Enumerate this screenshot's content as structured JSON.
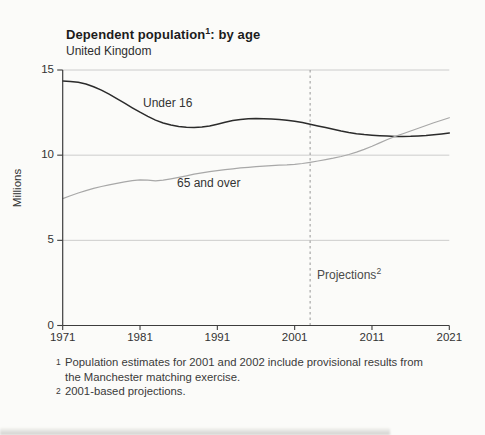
{
  "chart_data": {
    "type": "line",
    "title_main": "Dependent population",
    "title_sup": "1",
    "title_rest": ": by age",
    "subtitle": "United Kingdom",
    "ylabel": "Millions",
    "xlabel": "",
    "ylim": [
      0,
      15
    ],
    "yticks": [
      0,
      5,
      10,
      15
    ],
    "xlim": [
      1971,
      2021
    ],
    "xticks": [
      1971,
      1981,
      1991,
      2001,
      2011,
      2021
    ],
    "grid": "horizontal",
    "gridline_color": "#cccccc",
    "axis_color": "#3d3d3d",
    "projection_year": 2003,
    "projection_label": "Projections",
    "projection_sup": "2",
    "projection_line_color": "#979797",
    "x": [
      1971,
      1972,
      1973,
      1974,
      1975,
      1976,
      1977,
      1978,
      1979,
      1980,
      1981,
      1982,
      1983,
      1984,
      1985,
      1986,
      1987,
      1988,
      1989,
      1990,
      1991,
      1992,
      1993,
      1994,
      1995,
      1996,
      1997,
      1998,
      1999,
      2000,
      2001,
      2002,
      2003,
      2004,
      2005,
      2006,
      2007,
      2008,
      2009,
      2010,
      2011,
      2012,
      2013,
      2014,
      2015,
      2016,
      2017,
      2018,
      2019,
      2020,
      2021
    ],
    "series": [
      {
        "name": "Under 16",
        "color": "#2b2b2b",
        "stroke_width": 1.5,
        "values": [
          14.35,
          14.33,
          14.28,
          14.18,
          14.02,
          13.82,
          13.58,
          13.32,
          13.05,
          12.78,
          12.52,
          12.28,
          12.06,
          11.89,
          11.77,
          11.69,
          11.64,
          11.62,
          11.65,
          11.72,
          11.82,
          11.93,
          12.03,
          12.1,
          12.14,
          12.15,
          12.14,
          12.12,
          12.09,
          12.05,
          11.99,
          11.91,
          11.82,
          11.72,
          11.62,
          11.52,
          11.42,
          11.33,
          11.26,
          11.21,
          11.17,
          11.14,
          11.12,
          11.1,
          11.1,
          11.11,
          11.13,
          11.16,
          11.2,
          11.25,
          11.3
        ]
      },
      {
        "name": "65 and over",
        "color": "#a8a8a8",
        "stroke_width": 1.2,
        "values": [
          7.45,
          7.62,
          7.78,
          7.92,
          8.05,
          8.16,
          8.26,
          8.35,
          8.43,
          8.5,
          8.55,
          8.53,
          8.49,
          8.53,
          8.61,
          8.7,
          8.79,
          8.88,
          8.96,
          9.03,
          9.09,
          9.15,
          9.2,
          9.25,
          9.29,
          9.33,
          9.36,
          9.39,
          9.41,
          9.43,
          9.46,
          9.51,
          9.58,
          9.66,
          9.74,
          9.82,
          9.92,
          10.04,
          10.18,
          10.34,
          10.52,
          10.72,
          10.92,
          11.1,
          11.26,
          11.42,
          11.58,
          11.74,
          11.9,
          12.05,
          12.2
        ]
      }
    ]
  },
  "footnotes": [
    {
      "marker": "1",
      "lines": [
        "Population estimates for 2001 and 2002 include provisional results from",
        "the Manchester matching exercise."
      ]
    },
    {
      "marker": "2",
      "lines": [
        "2001-based projections."
      ]
    }
  ]
}
